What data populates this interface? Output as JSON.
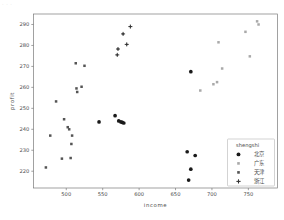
{
  "watermark": "· · ·",
  "chart_data": {
    "type": "scatter",
    "title": "",
    "xlabel": "income",
    "ylabel": "profit",
    "xlim": [
      455,
      790
    ],
    "ylim": [
      212,
      295
    ],
    "xticks": [
      500,
      550,
      600,
      650,
      700,
      750
    ],
    "yticks": [
      220,
      230,
      240,
      250,
      260,
      270,
      280,
      290
    ],
    "grid": false,
    "legend_position": "lower-right",
    "legend_title": "shengshi",
    "series": [
      {
        "name": "北京",
        "marker": "circle-filled",
        "color": "#1a1a1a",
        "points": [
          [
            567,
            246.5
          ],
          [
            572,
            244.0
          ],
          [
            575,
            243.5
          ],
          [
            577,
            243.3
          ],
          [
            579,
            243.0
          ],
          [
            545,
            243.5
          ],
          [
            671,
            267.5
          ],
          [
            666,
            229.3
          ],
          [
            677,
            227.5
          ],
          [
            671,
            221.0
          ],
          [
            668,
            215.8
          ]
        ]
      },
      {
        "name": "广东",
        "marker": "square-light",
        "color": "#8c8c8c",
        "points": [
          [
            702,
            261.5
          ],
          [
            707,
            262.5
          ],
          [
            714,
            269.0
          ],
          [
            709,
            281.5
          ],
          [
            746,
            286.5
          ],
          [
            752,
            274.8
          ],
          [
            762,
            291.5
          ],
          [
            764,
            290.0
          ],
          [
            684,
            258.5
          ]
        ]
      },
      {
        "name": "天津",
        "marker": "square",
        "color": "#555555",
        "points": [
          [
            486,
            253.3
          ],
          [
            497,
            244.8
          ],
          [
            502,
            241.0
          ],
          [
            504,
            240.0
          ],
          [
            508,
            237.0
          ],
          [
            507,
            233.0
          ],
          [
            494,
            226.0
          ],
          [
            506,
            226.3
          ],
          [
            478,
            237.0
          ],
          [
            472,
            221.8
          ],
          [
            513,
            271.5
          ],
          [
            525,
            270.3
          ],
          [
            514,
            259.5
          ],
          [
            521,
            260.3
          ],
          [
            515,
            257.8
          ]
        ]
      },
      {
        "name": "浙江",
        "marker": "plus",
        "color": "#333333",
        "points": [
          [
            570,
            275.5
          ],
          [
            571,
            278.3
          ],
          [
            578,
            285.5
          ],
          [
            583,
            280.5
          ],
          [
            588,
            289.0
          ]
        ]
      }
    ]
  }
}
